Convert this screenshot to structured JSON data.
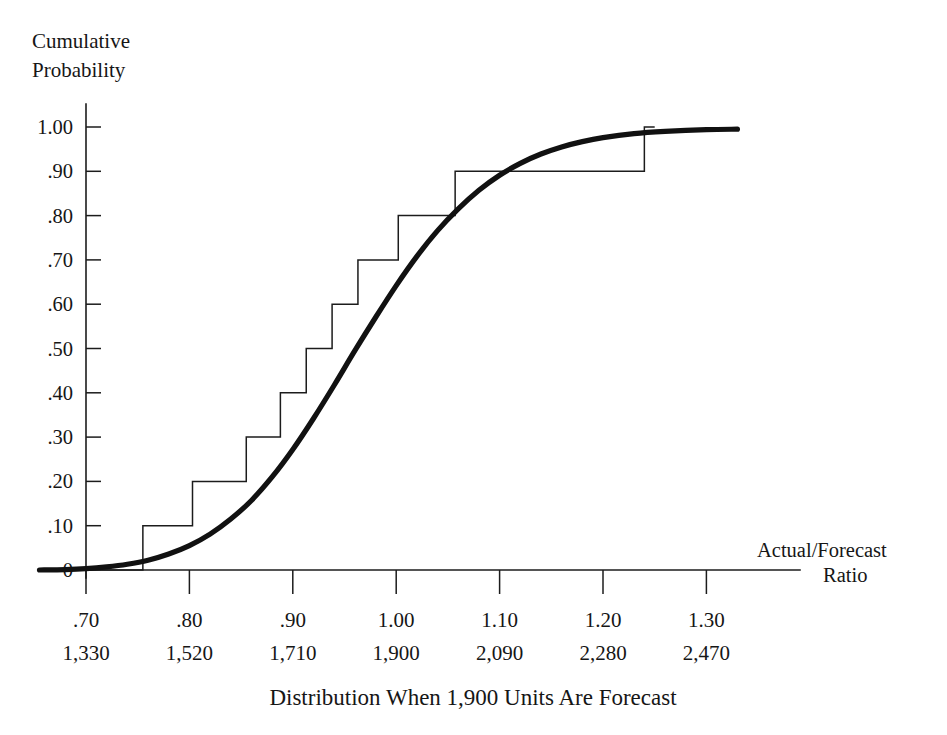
{
  "chart_data": {
    "type": "line",
    "title": "Cumulative Probability",
    "title_lines": [
      "Cumulative",
      "Probability"
    ],
    "caption": "Distribution When 1,900 Units Are Forecast",
    "xlabel": "Actual/Forecast Ratio",
    "xlabel_lines": [
      "Actual/Forecast",
      "Ratio"
    ],
    "ylabel": "Cumulative Probability",
    "grid": false,
    "legend": "none",
    "xlim": [
      0.655,
      1.355
    ],
    "ylim": [
      0,
      1.0
    ],
    "x_ticks": [
      0.7,
      0.8,
      0.9,
      1.0,
      1.1,
      1.2,
      1.3
    ],
    "x_tick_labels": [
      ".70",
      ".80",
      ".90",
      "1.00",
      "1.10",
      "1.20",
      "1.30"
    ],
    "x_secondary_labels": [
      "1,330",
      "1,520",
      "1,710",
      "1,900",
      "2,090",
      "2,280",
      "2,470"
    ],
    "x_secondary_name": "Units",
    "y_ticks": [
      0,
      0.1,
      0.2,
      0.3,
      0.4,
      0.5,
      0.6,
      0.7,
      0.8,
      0.9,
      1.0
    ],
    "y_tick_labels": [
      "0",
      ".10",
      ".20",
      ".30",
      ".40",
      ".50",
      ".60",
      ".70",
      ".80",
      ".90",
      "1.00"
    ],
    "series": [
      {
        "name": "Smooth cumulative distribution",
        "type": "line",
        "style": "thick-smooth",
        "x": [
          0.655,
          0.68,
          0.7,
          0.72,
          0.74,
          0.76,
          0.78,
          0.8,
          0.82,
          0.84,
          0.86,
          0.88,
          0.9,
          0.92,
          0.94,
          0.96,
          0.98,
          1.0,
          1.02,
          1.04,
          1.06,
          1.08,
          1.1,
          1.12,
          1.14,
          1.16,
          1.18,
          1.2,
          1.23,
          1.26,
          1.3,
          1.33
        ],
        "y": [
          0.0,
          0.001,
          0.003,
          0.007,
          0.013,
          0.022,
          0.036,
          0.055,
          0.081,
          0.115,
          0.157,
          0.21,
          0.272,
          0.342,
          0.417,
          0.495,
          0.57,
          0.642,
          0.708,
          0.766,
          0.815,
          0.857,
          0.891,
          0.918,
          0.939,
          0.955,
          0.967,
          0.976,
          0.985,
          0.99,
          0.994,
          0.995
        ]
      },
      {
        "name": "Empirical step function",
        "type": "step",
        "style": "thin-staircase",
        "steps": [
          {
            "x_start": 0.655,
            "x_end": 0.755,
            "y": 0.0
          },
          {
            "x_start": 0.755,
            "x_end": 0.803,
            "y": 0.1
          },
          {
            "x_start": 0.803,
            "x_end": 0.855,
            "y": 0.2
          },
          {
            "x_start": 0.855,
            "x_end": 0.888,
            "y": 0.3
          },
          {
            "x_start": 0.888,
            "x_end": 0.913,
            "y": 0.4
          },
          {
            "x_start": 0.913,
            "x_end": 0.938,
            "y": 0.5
          },
          {
            "x_start": 0.938,
            "x_end": 0.963,
            "y": 0.6
          },
          {
            "x_start": 0.963,
            "x_end": 1.002,
            "y": 0.7
          },
          {
            "x_start": 1.002,
            "x_end": 1.057,
            "y": 0.8
          },
          {
            "x_start": 1.057,
            "x_end": 1.12,
            "y": 0.9
          },
          {
            "x_start": 1.12,
            "x_end": 1.24,
            "y": 0.9
          },
          {
            "x_start": 1.24,
            "x_end": 1.25,
            "y": 1.0
          }
        ]
      }
    ]
  }
}
